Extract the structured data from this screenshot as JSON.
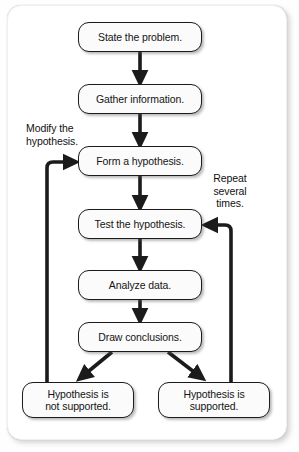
{
  "diagram": {
    "type": "flowchart",
    "nodes": [
      {
        "id": "state-the-problem",
        "label": "State the problem.",
        "x": 78,
        "y": 22,
        "w": 124,
        "h": 30
      },
      {
        "id": "gather-information",
        "label": "Gather information.",
        "x": 78,
        "y": 84,
        "w": 124,
        "h": 30
      },
      {
        "id": "form-a-hypothesis",
        "label": "Form a hypothesis.",
        "x": 78,
        "y": 146,
        "w": 124,
        "h": 30
      },
      {
        "id": "test-the-hypothesis",
        "label": "Test the hypothesis.",
        "x": 78,
        "y": 209,
        "w": 124,
        "h": 30
      },
      {
        "id": "analyze-data",
        "label": "Analyze data.",
        "x": 78,
        "y": 270,
        "w": 124,
        "h": 30
      },
      {
        "id": "draw-conclusions",
        "label": "Draw conclusions.",
        "x": 78,
        "y": 322,
        "w": 124,
        "h": 30
      },
      {
        "id": "hypothesis-not-supported",
        "label": "Hypothesis is\nnot supported.",
        "x": 22,
        "y": 382,
        "w": 112,
        "h": 36
      },
      {
        "id": "hypothesis-supported",
        "label": "Hypothesis is\nsupported.",
        "x": 158,
        "y": 382,
        "w": 112,
        "h": 36
      }
    ],
    "annotations": [
      {
        "id": "modify-the-hypothesis",
        "label": "Modify the\nhypothesis."
      },
      {
        "id": "repeat-several-times",
        "label": "Repeat\nseveral\ntimes."
      }
    ],
    "edges": [
      {
        "from": "state-the-problem",
        "to": "gather-information",
        "style": "straight-down"
      },
      {
        "from": "gather-information",
        "to": "form-a-hypothesis",
        "style": "straight-down"
      },
      {
        "from": "form-a-hypothesis",
        "to": "test-the-hypothesis",
        "style": "straight-down"
      },
      {
        "from": "test-the-hypothesis",
        "to": "analyze-data",
        "style": "straight-down"
      },
      {
        "from": "analyze-data",
        "to": "draw-conclusions",
        "style": "straight-down"
      },
      {
        "from": "draw-conclusions",
        "to": "hypothesis-not-supported",
        "style": "diagonal-left"
      },
      {
        "from": "draw-conclusions",
        "to": "hypothesis-supported",
        "style": "diagonal-right"
      },
      {
        "from": "hypothesis-not-supported",
        "to": "form-a-hypothesis",
        "style": "loop-left",
        "label": "Modify the\nhypothesis."
      },
      {
        "from": "hypothesis-supported",
        "to": "test-the-hypothesis",
        "style": "loop-right",
        "label": "Repeat\nseveral\ntimes."
      }
    ],
    "colors": {
      "line": "#1b1b1b",
      "node_fill": "#fbfbfb",
      "node_border": "#1b1b1b",
      "text": "#141414",
      "frame_background": "#ffffff",
      "page_background": "#fefefe"
    }
  }
}
